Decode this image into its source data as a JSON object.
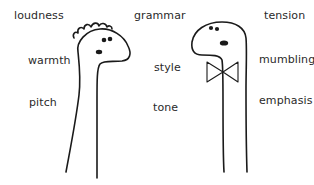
{
  "left_words": [
    {
      "text": "loudness"
    },
    {
      "text": "warmth"
    },
    {
      "text": "pitch"
    }
  ],
  "middle_words": [
    {
      "text": "grammar"
    },
    {
      "text": "style"
    },
    {
      "text": "tone"
    }
  ],
  "right_words": [
    {
      "text": "tension"
    },
    {
      "text": "mumbling"
    },
    {
      "text": "emphasis"
    }
  ],
  "figures": [
    {
      "name": "left-dinosaur",
      "features": [
        "hair-tuft",
        "eyes",
        "mouth"
      ]
    },
    {
      "name": "right-dinosaur",
      "features": [
        "eyes",
        "mouth",
        "bowtie"
      ]
    }
  ],
  "colors": {
    "ink": "#1a1a1a",
    "background": "#ffffff"
  }
}
